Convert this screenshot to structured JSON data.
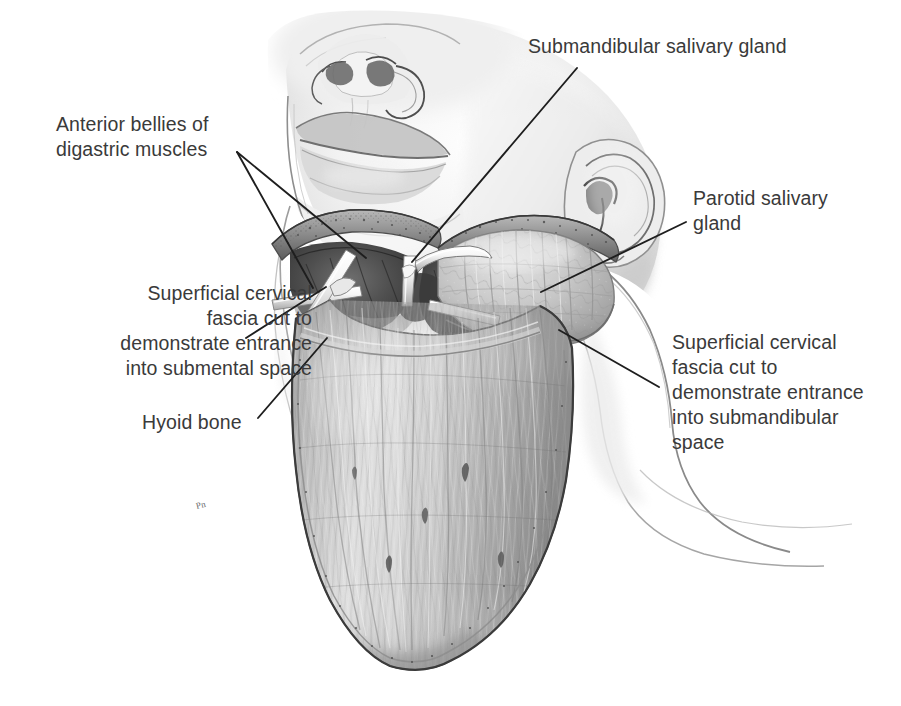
{
  "figure": {
    "kind": "anatomical-illustration",
    "medium": "grayscale pencil / airbrush medical illustration",
    "background_color": "#ffffff",
    "text_color": "#3a3a3a",
    "leader_color": "#1e1e1e",
    "signature": "Pn",
    "width": 901,
    "height": 706
  },
  "labels": [
    {
      "id": "submandibular-gland",
      "text": "Submandibular salivary gland",
      "align": "left",
      "x": 528,
      "y": 34,
      "leaders": [
        {
          "x1": 577,
          "y1": 68,
          "x2": 412,
          "y2": 262
        }
      ]
    },
    {
      "id": "anterior-digastric",
      "text": "Anterior bellies of\ndigastric muscles",
      "align": "left",
      "x": 56,
      "y": 112,
      "leaders": [
        {
          "x1": 237,
          "y1": 152,
          "x2": 366,
          "y2": 258
        },
        {
          "x1": 237,
          "y1": 152,
          "x2": 313,
          "y2": 288
        }
      ]
    },
    {
      "id": "parotid-gland",
      "text": "Parotid salivary\ngland",
      "align": "left",
      "x": 693,
      "y": 186,
      "leaders": [
        {
          "x1": 686,
          "y1": 222,
          "x2": 541,
          "y2": 292
        }
      ]
    },
    {
      "id": "superficial-fascia-submental",
      "text": "Superficial cervical\nfascia cut to\ndemonstrate entrance\ninto submental space",
      "align": "right",
      "x": 62,
      "y": 281,
      "leaders": [
        {
          "x1": 246,
          "y1": 338,
          "x2": 326,
          "y2": 287
        }
      ]
    },
    {
      "id": "hyoid-bone",
      "text": "Hyoid bone",
      "align": "left",
      "x": 142,
      "y": 410,
      "leaders": [
        {
          "x1": 258,
          "y1": 418,
          "x2": 327,
          "y2": 338
        }
      ]
    },
    {
      "id": "superficial-fascia-submandibular",
      "text": "Superficial cervical\nfascia cut to\ndemonstrate entrance\ninto submandibular\nspace",
      "align": "left",
      "x": 672,
      "y": 330,
      "leaders": [
        {
          "x1": 659,
          "y1": 387,
          "x2": 559,
          "y2": 330
        }
      ]
    }
  ],
  "anatomy_regions": [
    {
      "id": "face-chin",
      "name": "Chin and lower face viewed from below"
    },
    {
      "id": "nose",
      "name": "Nose seen from underneath, nostrils visible"
    },
    {
      "id": "lips",
      "name": "Upper and lower lips"
    },
    {
      "id": "right-ear",
      "name": "Right ear (patient's left) at upper right"
    },
    {
      "id": "submental-space",
      "name": "Dark opened submental space with retractors"
    },
    {
      "id": "submandibular-space",
      "name": "Dark opened submandibular space"
    },
    {
      "id": "submandibular-gland-body",
      "name": "Submandibular salivary gland, lobulated surface"
    },
    {
      "id": "cervical-fascia-flap",
      "name": "Large reflected superficial cervical fascia flap over the neck"
    },
    {
      "id": "retractors",
      "name": "White metal retractor instruments crossing the dissection"
    },
    {
      "id": "hyoid",
      "name": "Hyoid bone beneath the fascia flap"
    }
  ]
}
